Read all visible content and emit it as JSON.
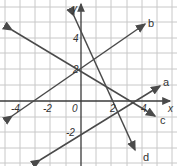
{
  "graph": {
    "axes": {
      "x_label": "x",
      "y_label": "y"
    },
    "x_ticks": [
      "-4",
      "-2",
      "0",
      "2",
      "4"
    ],
    "y_ticks": [
      "4",
      "2",
      "-2"
    ],
    "lines": [
      {
        "label": "a"
      },
      {
        "label": "b"
      },
      {
        "label": "c"
      },
      {
        "label": "d"
      }
    ],
    "colors": {
      "grid": "#c8c8c8",
      "line": "#4a4a4a",
      "axis": "#3a3a3a"
    }
  }
}
